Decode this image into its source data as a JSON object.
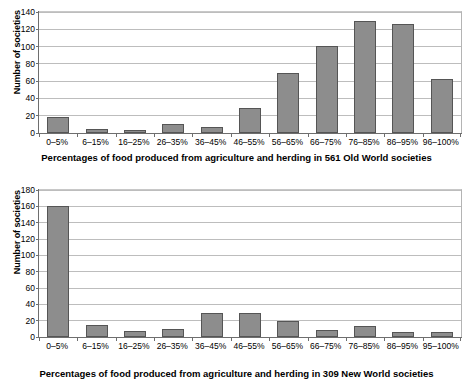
{
  "chart_data": [
    {
      "id": "old-world",
      "type": "bar",
      "title": "",
      "xlabel": "Percentages of food produced from agriculture and herding in 561 Old World societies",
      "ylabel": "Number of societies",
      "categories": [
        "0–5%",
        "6–15%",
        "16–25%",
        "26–35%",
        "36–45%",
        "46–55%",
        "56–65%",
        "66–75%",
        "76–85%",
        "86–95%",
        "96–100%"
      ],
      "values": [
        19,
        5,
        3,
        10,
        7,
        29,
        69,
        101,
        130,
        126,
        62
      ],
      "ylim": [
        0,
        140
      ],
      "yticks": [
        0,
        20,
        40,
        60,
        80,
        100,
        120,
        140
      ],
      "ytick_labels": [
        "0",
        "20",
        "40",
        "60",
        "80",
        "100",
        "120",
        "140"
      ],
      "grid": true,
      "legend": "none",
      "bar_color": "#8d8d8d",
      "bar_border_color": "#555555"
    },
    {
      "id": "new-world",
      "type": "bar",
      "title": "",
      "xlabel": "Percentages of food produced from agriculture and herding in 309 New World societies",
      "ylabel": "Number of societies",
      "categories": [
        "0–5%",
        "6–15%",
        "16–25%",
        "26–35%",
        "36–45%",
        "46–55%",
        "56–65%",
        "66–75%",
        "76–85%",
        "86–95%",
        "95–100%"
      ],
      "values": [
        161,
        15,
        7,
        10,
        30,
        30,
        19,
        8,
        13,
        6,
        6
      ],
      "ylim": [
        0,
        180
      ],
      "yticks": [
        0,
        20,
        40,
        60,
        80,
        100,
        120,
        140,
        160,
        180
      ],
      "ytick_labels": [
        "0",
        "20",
        "40",
        "60",
        "80",
        "100",
        "120",
        "140",
        "160",
        "180"
      ],
      "grid": true,
      "legend": "none",
      "bar_color": "#8d8d8d",
      "bar_border_color": "#555555"
    }
  ]
}
